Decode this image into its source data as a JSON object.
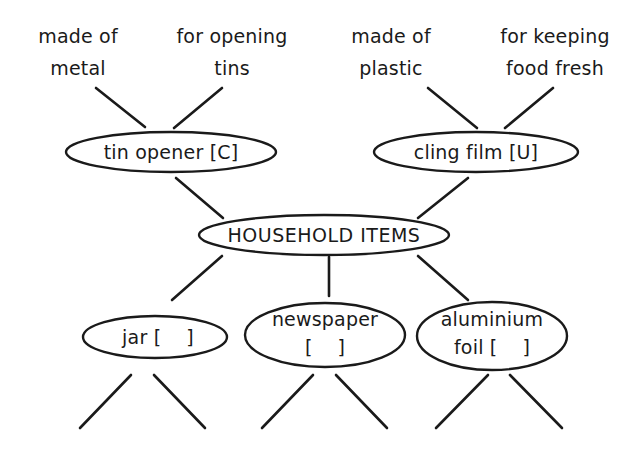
{
  "diagram": {
    "center": {
      "label": "HOUSEHOLD ITEMS"
    },
    "nodes": [
      {
        "id": "tin-opener",
        "label": "tin opener [C]",
        "attributes": [
          "made of metal",
          "for opening tins"
        ]
      },
      {
        "id": "cling-film",
        "label": "cling film [U]",
        "attributes": [
          "made of plastic",
          "for keeping food fresh"
        ]
      },
      {
        "id": "jar",
        "label": "jar [    ]",
        "attributes": [
          "",
          ""
        ]
      },
      {
        "id": "newspaper",
        "label_line1": "newspaper",
        "label_line2": "[    ]",
        "attributes": [
          "",
          ""
        ]
      },
      {
        "id": "aluminium-foil",
        "label_line1": "aluminium",
        "label_line2": "foil [    ]",
        "attributes": [
          "",
          ""
        ]
      }
    ],
    "attribute_text": {
      "tin_opener_1_line1": "made of",
      "tin_opener_1_line2": "metal",
      "tin_opener_2_line1": "for opening",
      "tin_opener_2_line2": "tins",
      "cling_film_1_line1": "made of",
      "cling_film_1_line2": "plastic",
      "cling_film_2_line1": "for keeping",
      "cling_film_2_line2": "food fresh"
    },
    "colors": {
      "stroke": "#1a1a1a",
      "background": "#ffffff"
    }
  }
}
